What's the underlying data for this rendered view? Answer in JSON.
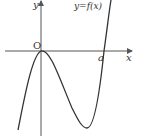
{
  "figure": {
    "type": "function-graph",
    "function_label": "y=f(x)",
    "axes": {
      "x_label": "x",
      "y_label": "y",
      "origin_label": "O"
    },
    "points": {
      "root_label": "a"
    },
    "colors": {
      "curve": "#333333",
      "axis": "#555555",
      "background": "#ffffff"
    }
  }
}
